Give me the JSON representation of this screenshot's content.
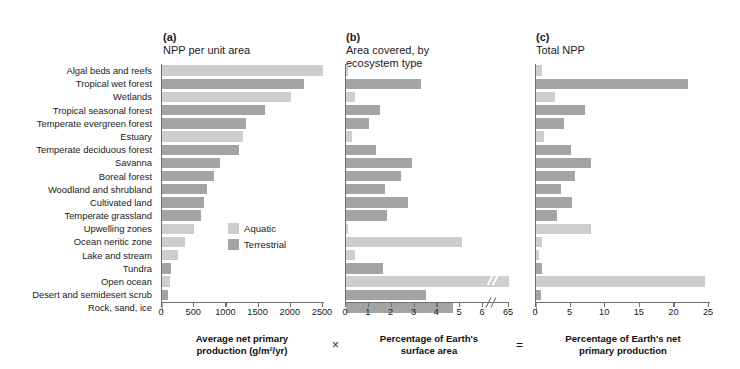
{
  "panels": {
    "a": {
      "tag": "(a)",
      "title": "NPP per unit area",
      "axis_caption": "Average net primary\nproduction (g/m²/yr)"
    },
    "b": {
      "tag": "(b)",
      "title": "Area covered, by\necosystem type",
      "axis_caption": "Percentage of Earth's\nsurface area"
    },
    "c": {
      "tag": "(c)",
      "title": "Total NPP",
      "axis_caption": "Percentage of Earth's net\nprimary production"
    }
  },
  "operators": {
    "times": "×",
    "equals": "="
  },
  "legend": {
    "items": [
      {
        "label": "Aquatic",
        "color": "#cdcecd",
        "key": "aquatic"
      },
      {
        "label": "Terrestrial",
        "color": "#a2a5a4",
        "key": "terrestrial"
      }
    ]
  },
  "chart_data": {
    "type": "bar",
    "orientation": "horizontal",
    "grid": false,
    "legend_position": "inside-panel-a",
    "categories": [
      "Algal beds and reefs",
      "Tropical wet forest",
      "Wetlands",
      "Tropical seasonal forest",
      "Temperate evergreen forest",
      "Estuary",
      "Temperate deciduous forest",
      "Savanna",
      "Boreal forest",
      "Woodland and shrubland",
      "Cultivated land",
      "Temperate grassland",
      "Upwelling zones",
      "Ocean neritic zone",
      "Lake and stream",
      "Tundra",
      "Open ocean",
      "Desert and semidesert scrub",
      "Rock, sand, ice"
    ],
    "group": [
      "aquatic",
      "terrestrial",
      "aquatic",
      "terrestrial",
      "terrestrial",
      "aquatic",
      "terrestrial",
      "terrestrial",
      "terrestrial",
      "terrestrial",
      "terrestrial",
      "terrestrial",
      "aquatic",
      "aquatic",
      "aquatic",
      "terrestrial",
      "aquatic",
      "terrestrial",
      "terrestrial"
    ],
    "subplots": [
      {
        "key": "a",
        "label": "(a) NPP per unit area",
        "xlabel": "Average net primary production (g/m²/yr)",
        "xlim": [
          0,
          2500
        ],
        "xticks": [
          0,
          500,
          1000,
          1500,
          2000,
          2500
        ],
        "values": [
          2500,
          2200,
          2000,
          1600,
          1300,
          1250,
          1200,
          900,
          800,
          700,
          650,
          600,
          500,
          360,
          250,
          140,
          125,
          90,
          3
        ]
      },
      {
        "key": "b",
        "label": "(b) Area covered, by ecosystem type",
        "xlabel": "Percentage of Earth's surface area",
        "xlim": [
          0,
          6
        ],
        "xticks": [
          0,
          1,
          2,
          3,
          4,
          5,
          6
        ],
        "axis_break": true,
        "break_tick_label": "65",
        "values": [
          0.1,
          3.3,
          0.4,
          1.5,
          1.0,
          0.27,
          1.3,
          2.9,
          2.4,
          1.7,
          2.7,
          1.8,
          0.1,
          5.1,
          0.4,
          1.6,
          65.0,
          3.5,
          4.7
        ]
      },
      {
        "key": "c",
        "label": "(c) Total NPP",
        "xlabel": "Percentage of Earth's net primary production",
        "xlim": [
          0,
          25
        ],
        "xticks": [
          0,
          5,
          10,
          15,
          20,
          25
        ],
        "values": [
          0.9,
          22.0,
          2.7,
          7.1,
          4.0,
          1.1,
          5.0,
          7.9,
          5.6,
          3.6,
          5.2,
          3.1,
          7.9,
          0.8,
          0.4,
          0.8,
          24.4,
          0.7,
          0.2
        ]
      }
    ]
  }
}
